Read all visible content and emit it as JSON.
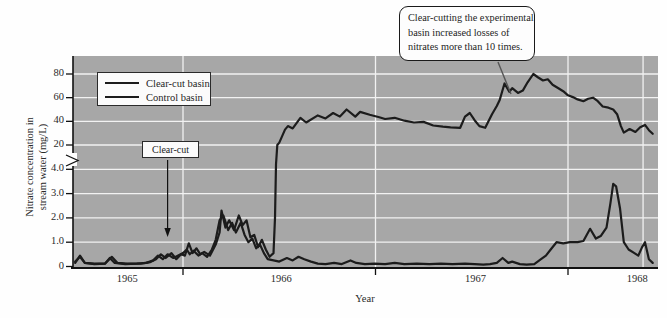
{
  "chart_data": {
    "type": "line",
    "xlabel": "Year",
    "ylabel": "Nitrate concentration in stream water (mg/L)",
    "ylabel_lines": [
      "Nitrate concentration in",
      "stream water (mg/L)"
    ],
    "xlim": [
      1965.43,
      1968.47
    ],
    "grid": true,
    "x_tick_labels": [
      {
        "text": "1965",
        "pos": 1965.71
      },
      {
        "text": "1966",
        "pos": 1966.51
      },
      {
        "text": "1967",
        "pos": 1967.52
      },
      {
        "text": "1968",
        "pos": 1968.36
      }
    ],
    "x_gridline_years": [
      1966,
      1967,
      1968,
      1968.39
    ],
    "x_axis_tick_years": [
      1966,
      1967,
      1968
    ],
    "y_axis": {
      "broken": true,
      "lower_section": {
        "tick_labels": [
          "0",
          "1.0",
          "2.0",
          "3.0",
          "4.0"
        ],
        "tick_values": [
          0,
          1,
          2,
          3,
          4
        ],
        "range": [
          0,
          4.3
        ],
        "unit": "mg/L"
      },
      "upper_section": {
        "tick_labels": [
          "20",
          "40",
          "60",
          "80"
        ],
        "tick_values": [
          20,
          40,
          60,
          80
        ],
        "range": [
          20,
          84
        ]
      },
      "gridline_values": [
        1,
        2,
        3,
        4,
        20,
        40,
        60,
        80
      ]
    },
    "legend": {
      "position": "top-left"
    },
    "series": [
      {
        "name": "Clear-cut basin",
        "color": "#1c1c1c",
        "points": [
          [
            1965.44,
            0.15
          ],
          [
            1965.465,
            0.45
          ],
          [
            1965.49,
            0.15
          ],
          [
            1965.54,
            0.12
          ],
          [
            1965.595,
            0.12
          ],
          [
            1965.63,
            0.4
          ],
          [
            1965.66,
            0.15
          ],
          [
            1965.71,
            0.12
          ],
          [
            1965.78,
            0.12
          ],
          [
            1965.83,
            0.18
          ],
          [
            1965.86,
            0.3
          ],
          [
            1965.885,
            0.5
          ],
          [
            1965.91,
            0.35
          ],
          [
            1965.94,
            0.55
          ],
          [
            1965.965,
            0.3
          ],
          [
            1965.99,
            0.5
          ],
          [
            1966.01,
            0.45
          ],
          [
            1966.03,
            0.95
          ],
          [
            1966.05,
            0.55
          ],
          [
            1966.07,
            0.75
          ],
          [
            1966.09,
            0.5
          ],
          [
            1966.11,
            0.6
          ],
          [
            1966.14,
            0.45
          ],
          [
            1966.17,
            0.9
          ],
          [
            1966.19,
            1.4
          ],
          [
            1966.2,
            2.3
          ],
          [
            1966.22,
            1.6
          ],
          [
            1966.24,
            1.9
          ],
          [
            1966.265,
            1.5
          ],
          [
            1966.29,
            2.1
          ],
          [
            1966.31,
            1.7
          ],
          [
            1966.33,
            1.9
          ],
          [
            1966.35,
            1.2
          ],
          [
            1966.37,
            1.3
          ],
          [
            1966.39,
            0.8
          ],
          [
            1966.41,
            1.1
          ],
          [
            1966.43,
            0.7
          ],
          [
            1966.45,
            0.4
          ],
          [
            1966.47,
            0.55
          ],
          [
            1966.478,
            2.0
          ],
          [
            1966.483,
            4.2
          ],
          [
            1966.49,
            20
          ],
          [
            1966.5,
            22
          ],
          [
            1966.53,
            33
          ],
          [
            1966.545,
            36
          ],
          [
            1966.57,
            34
          ],
          [
            1966.61,
            43
          ],
          [
            1966.64,
            39
          ],
          [
            1966.7,
            45
          ],
          [
            1966.74,
            42.5
          ],
          [
            1966.78,
            47
          ],
          [
            1966.815,
            44
          ],
          [
            1966.85,
            50
          ],
          [
            1966.895,
            44
          ],
          [
            1966.92,
            48
          ],
          [
            1966.97,
            45.5
          ],
          [
            1967.02,
            43.5
          ],
          [
            1967.05,
            42
          ],
          [
            1967.1,
            43
          ],
          [
            1967.15,
            40.5
          ],
          [
            1967.2,
            39
          ],
          [
            1967.25,
            39.5
          ],
          [
            1967.3,
            36.5
          ],
          [
            1967.35,
            35.5
          ],
          [
            1967.39,
            35
          ],
          [
            1967.44,
            34.5
          ],
          [
            1967.465,
            44
          ],
          [
            1967.49,
            47
          ],
          [
            1967.515,
            41
          ],
          [
            1967.54,
            36
          ],
          [
            1967.57,
            34.5
          ],
          [
            1967.605,
            46
          ],
          [
            1967.63,
            53
          ],
          [
            1967.645,
            58
          ],
          [
            1967.67,
            72
          ],
          [
            1967.695,
            65
          ],
          [
            1967.71,
            68
          ],
          [
            1967.74,
            64
          ],
          [
            1967.765,
            66
          ],
          [
            1967.79,
            73
          ],
          [
            1967.82,
            80
          ],
          [
            1967.845,
            77
          ],
          [
            1967.87,
            74.5
          ],
          [
            1967.895,
            75.5
          ],
          [
            1967.92,
            71
          ],
          [
            1967.95,
            68
          ],
          [
            1967.975,
            65.5
          ],
          [
            1968.0,
            62
          ],
          [
            1968.025,
            60.5
          ],
          [
            1968.05,
            58.5
          ],
          [
            1968.08,
            57
          ],
          [
            1968.105,
            59
          ],
          [
            1968.13,
            60
          ],
          [
            1968.155,
            57
          ],
          [
            1968.18,
            52.5
          ],
          [
            1968.21,
            51.5
          ],
          [
            1968.235,
            50
          ],
          [
            1968.255,
            46
          ],
          [
            1968.275,
            36
          ],
          [
            1968.29,
            30.5
          ],
          [
            1968.32,
            33.5
          ],
          [
            1968.35,
            31
          ],
          [
            1968.375,
            35
          ],
          [
            1968.4,
            37
          ],
          [
            1968.42,
            32.5
          ],
          [
            1968.44,
            29.5
          ]
        ]
      },
      {
        "name": "Control basin",
        "color": "#1c1c1c",
        "points": [
          [
            1965.44,
            0.2
          ],
          [
            1965.465,
            0.4
          ],
          [
            1965.49,
            0.15
          ],
          [
            1965.54,
            0.1
          ],
          [
            1965.595,
            0.12
          ],
          [
            1965.62,
            0.35
          ],
          [
            1965.645,
            0.15
          ],
          [
            1965.7,
            0.1
          ],
          [
            1965.76,
            0.12
          ],
          [
            1965.81,
            0.15
          ],
          [
            1965.845,
            0.25
          ],
          [
            1965.87,
            0.45
          ],
          [
            1965.895,
            0.3
          ],
          [
            1965.92,
            0.5
          ],
          [
            1965.95,
            0.35
          ],
          [
            1965.975,
            0.45
          ],
          [
            1966.0,
            0.55
          ],
          [
            1966.02,
            0.7
          ],
          [
            1966.035,
            0.5
          ],
          [
            1966.055,
            0.65
          ],
          [
            1966.08,
            0.45
          ],
          [
            1966.1,
            0.55
          ],
          [
            1966.125,
            0.4
          ],
          [
            1966.15,
            0.7
          ],
          [
            1966.17,
            1.1
          ],
          [
            1966.19,
            1.9
          ],
          [
            1966.21,
            2.1
          ],
          [
            1966.235,
            1.5
          ],
          [
            1966.255,
            1.8
          ],
          [
            1966.275,
            1.4
          ],
          [
            1966.3,
            1.8
          ],
          [
            1966.32,
            1.3
          ],
          [
            1966.34,
            1.0
          ],
          [
            1966.36,
            1.15
          ],
          [
            1966.38,
            0.75
          ],
          [
            1966.4,
            0.9
          ],
          [
            1966.42,
            0.55
          ],
          [
            1966.44,
            0.3
          ],
          [
            1966.47,
            0.25
          ],
          [
            1966.5,
            0.2
          ],
          [
            1966.54,
            0.35
          ],
          [
            1966.57,
            0.25
          ],
          [
            1966.6,
            0.4
          ],
          [
            1966.63,
            0.3
          ],
          [
            1966.665,
            0.2
          ],
          [
            1966.7,
            0.12
          ],
          [
            1966.74,
            0.1
          ],
          [
            1966.785,
            0.15
          ],
          [
            1966.825,
            0.1
          ],
          [
            1966.87,
            0.25
          ],
          [
            1966.9,
            0.15
          ],
          [
            1966.945,
            0.1
          ],
          [
            1966.995,
            0.12
          ],
          [
            1967.05,
            0.1
          ],
          [
            1967.1,
            0.15
          ],
          [
            1967.15,
            0.1
          ],
          [
            1967.215,
            0.12
          ],
          [
            1967.28,
            0.1
          ],
          [
            1967.34,
            0.12
          ],
          [
            1967.4,
            0.1
          ],
          [
            1967.465,
            0.12
          ],
          [
            1967.515,
            0.1
          ],
          [
            1967.56,
            0.08
          ],
          [
            1967.595,
            0.1
          ],
          [
            1967.63,
            0.15
          ],
          [
            1967.66,
            0.35
          ],
          [
            1967.69,
            0.15
          ],
          [
            1967.71,
            0.2
          ],
          [
            1967.75,
            0.1
          ],
          [
            1967.785,
            0.08
          ],
          [
            1967.825,
            0.1
          ],
          [
            1967.86,
            0.3
          ],
          [
            1967.885,
            0.45
          ],
          [
            1967.91,
            0.7
          ],
          [
            1967.94,
            1.0
          ],
          [
            1967.975,
            0.95
          ],
          [
            1968.01,
            1.0
          ],
          [
            1968.05,
            1.0
          ],
          [
            1968.08,
            1.05
          ],
          [
            1968.115,
            1.55
          ],
          [
            1968.145,
            1.15
          ],
          [
            1968.17,
            1.25
          ],
          [
            1968.2,
            1.6
          ],
          [
            1968.22,
            2.6
          ],
          [
            1968.235,
            3.4
          ],
          [
            1968.25,
            3.3
          ],
          [
            1968.27,
            2.4
          ],
          [
            1968.29,
            1.0
          ],
          [
            1968.315,
            0.7
          ],
          [
            1968.345,
            0.55
          ],
          [
            1968.365,
            0.45
          ],
          [
            1968.385,
            0.8
          ],
          [
            1968.4,
            1.0
          ],
          [
            1968.42,
            0.3
          ],
          [
            1968.44,
            0.15
          ]
        ]
      }
    ],
    "annotations": {
      "clearcut_label": {
        "text": "Clear-cut",
        "arrow_target_year": 1965.92
      },
      "callout": {
        "text": "Clear-cutting the experimental basin increased losses of nitrates more than 10 times.",
        "lines": [
          "Clear-cutting the experimental",
          "basin increased losses of",
          "nitrates more than 10 times."
        ]
      }
    }
  },
  "colors": {
    "page_bg": "#fefefe",
    "plot_bg": "#a7a7a7",
    "gridline": "#f2f2f2",
    "axis": "#111111",
    "line": "#1c1c1c",
    "box_bg": "#fbfbfb",
    "box_border": "#2a2a2a"
  }
}
